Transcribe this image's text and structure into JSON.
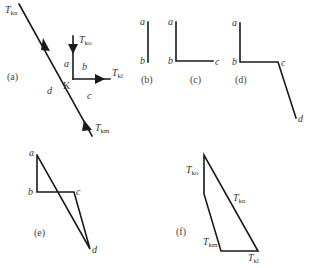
{
  "figure": {
    "panels": {
      "a": {
        "caption": "(a)",
        "node_label": "K",
        "forces": {
          "kn": {
            "T": "T",
            "sub": "kn"
          },
          "ko": {
            "T": "T",
            "sub": "ko"
          },
          "kl": {
            "T": "T",
            "sub": "kl"
          },
          "km": {
            "T": "T",
            "sub": "km"
          }
        },
        "spaces": {
          "a": "a",
          "b": "b",
          "c": "c",
          "d": "d"
        }
      },
      "b": {
        "caption": "(b)",
        "points": {
          "a": "a",
          "b": "b"
        }
      },
      "c": {
        "caption": "(c)",
        "points": {
          "a": "a",
          "b": "b",
          "c": "c"
        }
      },
      "d": {
        "caption": "(d)",
        "points": {
          "a": "a",
          "b": "b",
          "c": "c",
          "d": "d"
        }
      },
      "e": {
        "caption": "(e)",
        "points": {
          "a": "a",
          "b": "b",
          "c": "c",
          "d": "d"
        }
      },
      "f": {
        "caption": "(f)",
        "labels": {
          "ko": {
            "T": "T",
            "sub": "ko"
          },
          "kn": {
            "T": "T",
            "sub": "kn"
          },
          "km": {
            "T": "T",
            "sub": "km"
          },
          "kl": {
            "T": "T",
            "sub": "kl"
          }
        }
      }
    },
    "colors": {
      "stroke": "#1a1a1a",
      "text": "#333333"
    }
  }
}
